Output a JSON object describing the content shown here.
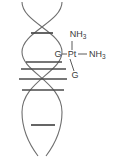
{
  "figure": {
    "width": 118,
    "height": 157,
    "background_color": "#ffffff"
  },
  "colors": {
    "strand": "#6e6e6e",
    "rung": "#4a4a4a",
    "bond": "#5a5a5a",
    "text": "#3b3b3b"
  },
  "labels": {
    "ammine_top": {
      "text": "NH",
      "subscript": "3",
      "x": 78,
      "y": 37
    },
    "ammine_right": {
      "text": "NH",
      "subscript": "3",
      "x": 90,
      "y": 57
    },
    "platinum": {
      "text": "Pt",
      "x": 70,
      "y": 57
    },
    "guanine_upper": {
      "text": "G",
      "x": 57,
      "y": 57
    },
    "guanine_lower": {
      "text": "G",
      "x": 71,
      "y": 77
    }
  },
  "helix": {
    "strands": [
      {
        "name": "strand-left",
        "path": "M 22,2 C 22,22 62,32 62,52 C 62,72 22,82 22,112 C 22,132 32,148 38,156"
      },
      {
        "name": "strand-right",
        "path": "M 62,2 C 62,22 22,32 22,52 C 22,72 62,82 62,112 C 62,132 52,148 46,156"
      }
    ],
    "crossings": [
      {
        "name": "upper-crossing",
        "x": 42,
        "y": 42
      },
      {
        "name": "lower-crossing",
        "x": 43,
        "y": 112
      }
    ]
  },
  "base_pairs": [
    {
      "name": "rung-1",
      "x1": 31,
      "x2": 53,
      "y": 33
    },
    {
      "name": "rung-2",
      "x1": 26,
      "x2": 62,
      "y": 62
    },
    {
      "name": "rung-3",
      "x1": 21,
      "x2": 66,
      "y": 69
    },
    {
      "name": "rung-4",
      "x1": 19,
      "x2": 67,
      "y": 79
    },
    {
      "name": "rung-5",
      "x1": 22,
      "x2": 64,
      "y": 90
    },
    {
      "name": "rung-6",
      "x1": 31,
      "x2": 55,
      "y": 125
    }
  ],
  "bonds": [
    {
      "name": "bond-pt-ammine-top",
      "x1": 72,
      "y1": 41,
      "x2": 72,
      "y2": 50
    },
    {
      "name": "bond-pt-ammine-right",
      "x1": 78,
      "y1": 54,
      "x2": 87,
      "y2": 54
    },
    {
      "name": "bond-pt-guanine-upper",
      "x1": 62,
      "y1": 54,
      "x2": 67,
      "y2": 54
    },
    {
      "name": "bond-pt-guanine-lower",
      "x1": 70,
      "y1": 59,
      "x2": 74,
      "y2": 71
    }
  ]
}
